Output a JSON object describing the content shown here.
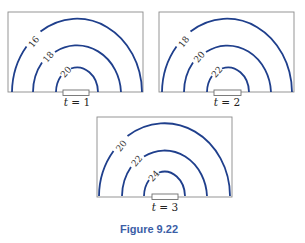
{
  "figure": {
    "caption": "Figure 9.22",
    "caption_color": "#3b5ea6",
    "arc_color": "#1f3f8c",
    "panels": [
      {
        "time_label_var": "t",
        "time_label_eq": " = ",
        "time_value": "1",
        "contours": [
          {
            "level": "16",
            "rank": "outer"
          },
          {
            "level": "18",
            "rank": "middle"
          },
          {
            "level": "20",
            "rank": "inner"
          }
        ]
      },
      {
        "time_label_var": "t",
        "time_label_eq": " = ",
        "time_value": "2",
        "contours": [
          {
            "level": "18",
            "rank": "outer"
          },
          {
            "level": "20",
            "rank": "middle"
          },
          {
            "level": "22",
            "rank": "inner"
          }
        ]
      },
      {
        "time_label_var": "t",
        "time_label_eq": " = ",
        "time_value": "3",
        "contours": [
          {
            "level": "20",
            "rank": "outer"
          },
          {
            "level": "22",
            "rank": "middle"
          },
          {
            "level": "24",
            "rank": "inner"
          }
        ]
      }
    ]
  }
}
